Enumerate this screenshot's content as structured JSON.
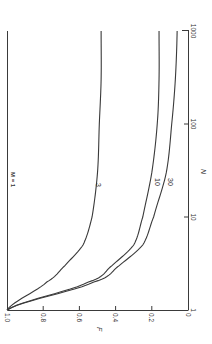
{
  "chart_data": {
    "type": "line",
    "orientation": "rotated-90-ccw",
    "title": "",
    "xlabel": "N",
    "ylabel": "F",
    "x_scale": "log",
    "xlim": [
      1,
      1000
    ],
    "ylim": [
      0,
      1.0
    ],
    "x_ticks": [
      "1",
      "10",
      "100",
      "1000"
    ],
    "y_ticks": [
      "1.0",
      "0.8",
      "0.6",
      "0.4",
      "0.2",
      "0"
    ],
    "grid": false,
    "legend": "inline curve labels",
    "annotations": [
      "M = 1"
    ],
    "x": [
      1,
      2,
      3,
      5,
      10,
      30,
      100,
      300,
      1000
    ],
    "series": [
      {
        "name": "M = 1",
        "label": "M = 1",
        "values": [
          1.0,
          1.0,
          1.0,
          1.0,
          1.0,
          1.0,
          1.0,
          1.0,
          1.0
        ]
      },
      {
        "name": "M = 3",
        "label": "3",
        "values": [
          1.0,
          0.78,
          0.68,
          0.58,
          0.53,
          0.5,
          0.49,
          0.48,
          0.48
        ]
      },
      {
        "name": "M = 10",
        "label": "10",
        "values": [
          1.0,
          0.55,
          0.42,
          0.3,
          0.25,
          0.2,
          0.17,
          0.16,
          0.16
        ]
      },
      {
        "name": "M = 30",
        "label": "30",
        "values": [
          1.0,
          0.52,
          0.38,
          0.25,
          0.19,
          0.12,
          0.09,
          0.07,
          0.06
        ]
      }
    ]
  },
  "labels": {
    "m_annotation": "M = 1",
    "x_axis": "N",
    "y_axis": "F",
    "curve_3": "3",
    "curve_10": "10",
    "curve_30": "30"
  },
  "colors": {
    "line": "#3a3a3a",
    "background": "#ffffff"
  }
}
